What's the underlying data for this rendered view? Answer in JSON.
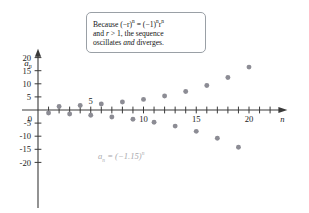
{
  "chart_data": {
    "type": "scatter",
    "title": "",
    "xlabel": "n",
    "ylabel": "a_n",
    "xlim": [
      0,
      22.5
    ],
    "ylim": [
      -22,
      23
    ],
    "grid": false,
    "legend": "none",
    "series_formula": "a_n = (-1.15)^n",
    "x": [
      1,
      2,
      3,
      4,
      5,
      6,
      7,
      8,
      9,
      10,
      11,
      12,
      13,
      14,
      15,
      16,
      17,
      18,
      19,
      20
    ],
    "values": [
      -1.15,
      1.32,
      -1.52,
      1.75,
      -2.01,
      2.31,
      -2.66,
      3.06,
      -3.52,
      4.05,
      -4.65,
      5.35,
      -6.15,
      7.08,
      -8.14,
      9.36,
      -10.76,
      12.38,
      -14.23,
      16.37
    ],
    "x_ticks": [
      1,
      2,
      3,
      4,
      5,
      6,
      7,
      8,
      9,
      10,
      11,
      12,
      13,
      14,
      15,
      16,
      17,
      18,
      19,
      20,
      21,
      22
    ],
    "x_tick_labels": [
      {
        "value": 5,
        "label": "5",
        "side": "above"
      },
      {
        "value": 10,
        "label": "10",
        "side": "below"
      },
      {
        "value": 15,
        "label": "15",
        "side": "below"
      },
      {
        "value": 20,
        "label": "20",
        "side": "below"
      }
    ],
    "y_ticks": [
      -20,
      -15,
      -10,
      -5,
      0,
      5,
      10,
      15,
      20
    ],
    "y_tick_labels": [
      "-20",
      "-15",
      "-10",
      "-5",
      "0",
      "5",
      "10",
      "15",
      "20"
    ],
    "point_color": "#8c8c94",
    "axis_color": "#3a3a3a"
  },
  "annotation": {
    "line1_a": "Because (−r)",
    "line1_exp1": "n",
    "line1_b": " = (−1)",
    "line1_exp2": "n",
    "line1_c": "r",
    "line1_exp3": "n",
    "line2_a": "and ",
    "line2_r": "r",
    "line2_b": " > 1, the sequence",
    "line3_a": "oscillates ",
    "line3_em": "and",
    "line3_b": " diverges."
  },
  "equation_label": {
    "a": "a",
    "sub": "n",
    "eq": " = (−1.15)",
    "exp": "n"
  },
  "axis_labels": {
    "y_symbol": "a",
    "y_sub": "n",
    "x_symbol": "n"
  }
}
